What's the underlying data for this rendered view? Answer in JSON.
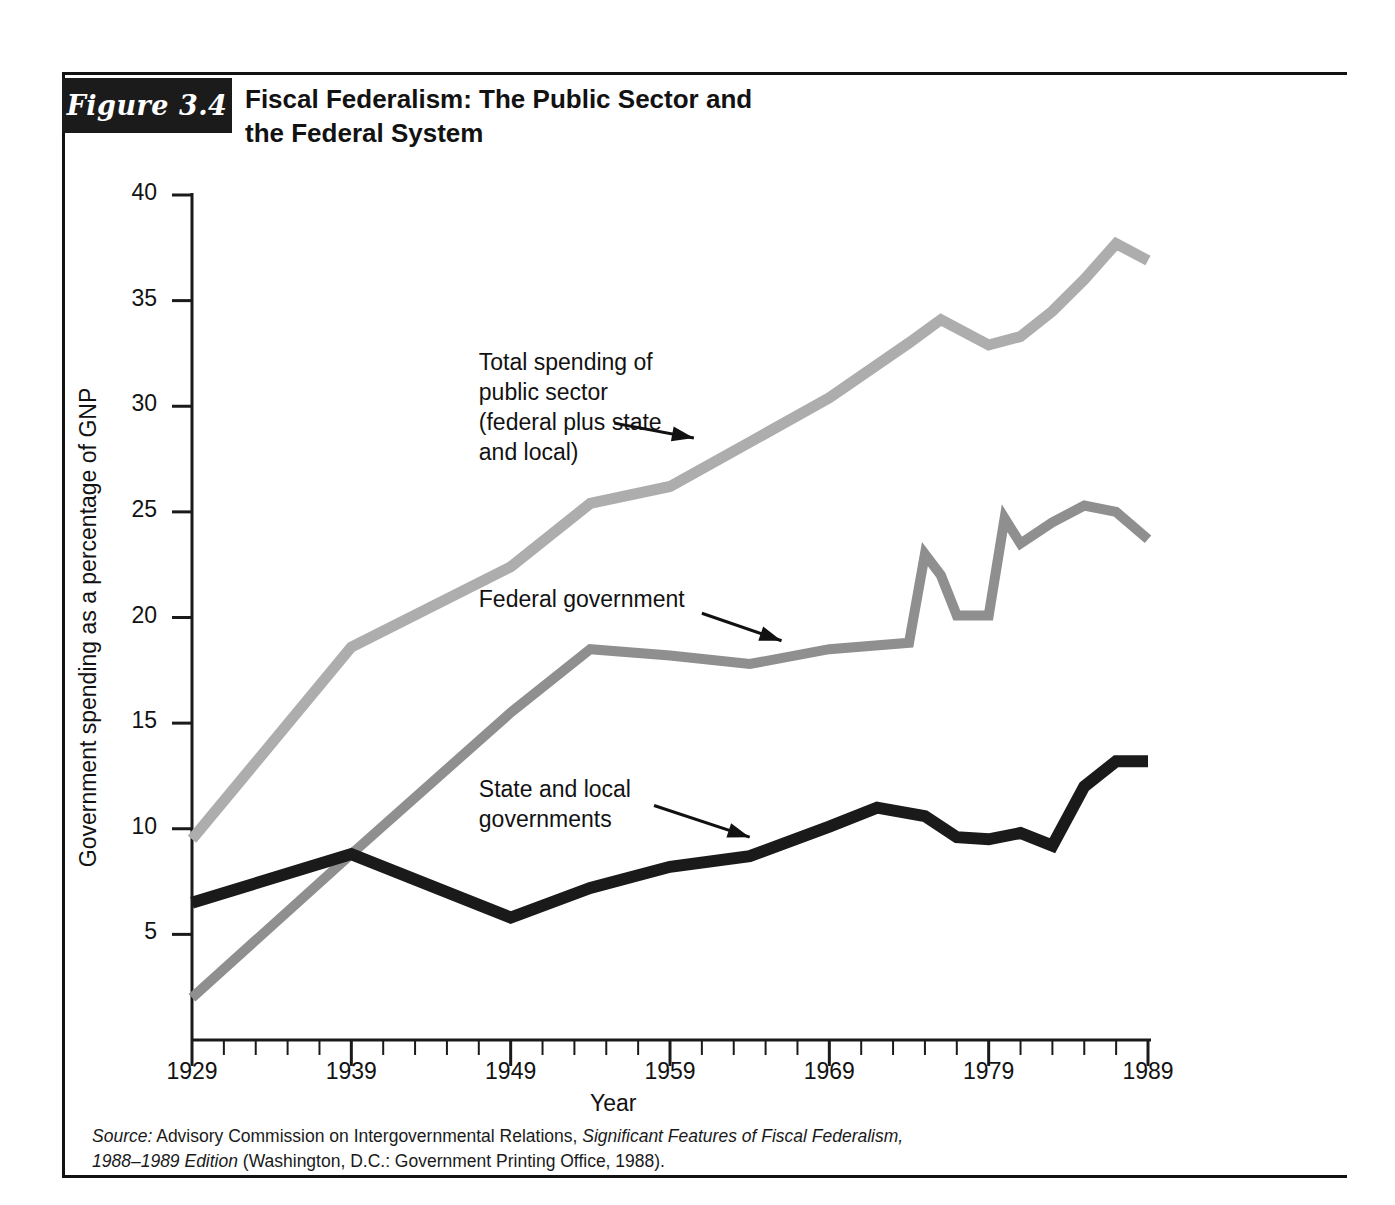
{
  "figure": {
    "badge": "Figure 3.4",
    "title": "Fiscal Federalism: The Public Sector and the Federal System",
    "title_line1": "Fiscal Federalism: The Public Sector and",
    "title_line2": "the Federal System",
    "source_prefix": "Source:",
    "source_text_1": " Advisory Commission on Intergovernmental Relations, ",
    "source_italic_1": "Significant Features of Fiscal Federalism,",
    "source_italic_2": "1988–1989 Edition",
    "source_text_2": " (Washington, D.C.: Government Printing Office, 1988)."
  },
  "colors": {
    "total_line": "#adadad",
    "federal_line": "#8f8f8f",
    "state_local_line": "#1a1a1a",
    "axis": "#1a1a1a",
    "badge_background": "#1b1b1b",
    "text": "#121212",
    "page_background": "#ffffff"
  },
  "chart_data": {
    "type": "line",
    "title": "Fiscal Federalism: The Public Sector and the Federal System",
    "xlabel": "Year",
    "ylabel": "Government spending as a percentage of GNP",
    "xlim": [
      1929,
      1989
    ],
    "ylim": [
      0,
      40
    ],
    "yticks": [
      5,
      10,
      15,
      20,
      25,
      30,
      35,
      40
    ],
    "ytick_labels": [
      "5",
      "10",
      "15",
      "20",
      "25",
      "30",
      "35",
      "40"
    ],
    "xticks": [
      1929,
      1939,
      1949,
      1959,
      1969,
      1979,
      1989
    ],
    "xtick_labels": [
      "1929",
      "1939",
      "1949",
      "1959",
      "1969",
      "1979",
      "1989"
    ],
    "x_minor_tick_interval": 2,
    "grid": false,
    "legend": "annotations",
    "series": [
      {
        "name": "Total spending of public sector (federal plus state and local)",
        "color": "#adadad",
        "x": [
          1929,
          1939,
          1949,
          1954,
          1959,
          1964,
          1969,
          1974,
          1976,
          1979,
          1981,
          1983,
          1985,
          1987,
          1989
        ],
        "y": [
          9.5,
          18.6,
          22.4,
          25.4,
          26.2,
          28.3,
          30.4,
          33.0,
          34.1,
          32.9,
          33.3,
          34.5,
          36.0,
          37.7,
          36.9
        ]
      },
      {
        "name": "Federal government",
        "color": "#8f8f8f",
        "x": [
          1929,
          1939,
          1949,
          1954,
          1959,
          1964,
          1969,
          1974,
          1975,
          1976,
          1977,
          1979,
          1980,
          1981,
          1983,
          1985,
          1987,
          1989
        ],
        "y": [
          2.0,
          8.8,
          15.5,
          18.5,
          18.2,
          17.8,
          18.5,
          18.8,
          23.0,
          22.0,
          20.1,
          20.1,
          24.7,
          23.5,
          24.5,
          25.3,
          25.0,
          23.7
        ]
      },
      {
        "name": "State and local governments",
        "color": "#1a1a1a",
        "x": [
          1929,
          1939,
          1949,
          1954,
          1959,
          1964,
          1969,
          1972,
          1975,
          1977,
          1979,
          1981,
          1983,
          1985,
          1987,
          1989
        ],
        "y": [
          6.5,
          8.8,
          5.8,
          7.2,
          8.2,
          8.7,
          10.1,
          11.0,
          10.6,
          9.6,
          9.5,
          9.8,
          9.2,
          12.0,
          13.2,
          13.2
        ]
      }
    ],
    "annotations": [
      {
        "name": "total-spending-annotation",
        "text": "Total spending of\npublic sector\n(federal plus state\nand local)",
        "label_x": 1947.0,
        "label_y": 31.8,
        "arrow_from_x": 1955.5,
        "arrow_from_y": 29.2,
        "arrow_to_x": 1960.5,
        "arrow_to_y": 28.5
      },
      {
        "name": "federal-government-annotation",
        "text": "Federal government",
        "label_x": 1947.0,
        "label_y": 20.6,
        "arrow_from_x": 1961.0,
        "arrow_from_y": 20.2,
        "arrow_to_x": 1966.0,
        "arrow_to_y": 18.9
      },
      {
        "name": "state-and-local-annotation",
        "text": "State and local\ngovernments",
        "label_x": 1947.0,
        "label_y": 11.6,
        "arrow_from_x": 1958.0,
        "arrow_from_y": 11.1,
        "arrow_to_x": 1964.0,
        "arrow_to_y": 9.6
      }
    ]
  }
}
